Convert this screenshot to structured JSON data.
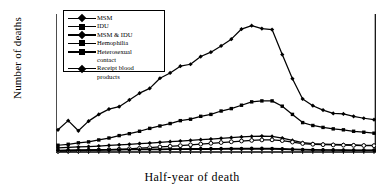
{
  "chart_data": {
    "type": "line",
    "title": "",
    "xlabel": "Half-year of death",
    "ylabel": "Number of deaths",
    "ylim": [
      0,
      14000
    ],
    "ytick_labels": [
      "0",
      "2,000",
      "4,000",
      "6,000",
      "8,000",
      "10,000",
      "12,000",
      "14,000"
    ],
    "ytick_values": [
      0,
      2000,
      4000,
      6000,
      8000,
      10000,
      12000,
      14000
    ],
    "grid": false,
    "legend_position": "upper-left-inside",
    "x_year_labels": [
      "1985",
      "1986",
      "1987",
      "1988",
      "1989",
      "1990",
      "1991",
      "1992",
      "1993",
      "1994",
      "1995",
      "1996",
      "1997",
      "1998",
      "1999",
      "2000"
    ],
    "x_note": "two half-year points per year",
    "x": [
      1985.0,
      1985.5,
      1986.0,
      1986.5,
      1987.0,
      1987.5,
      1988.0,
      1988.5,
      1989.0,
      1989.5,
      1990.0,
      1990.5,
      1991.0,
      1991.5,
      1992.0,
      1992.5,
      1993.0,
      1993.5,
      1994.0,
      1994.5,
      1995.0,
      1995.5,
      1996.0,
      1996.5,
      1997.0,
      1997.5,
      1998.0,
      1998.5,
      1999.0,
      1999.5,
      2000.0,
      2000.5
    ],
    "series": [
      {
        "name": "MSM",
        "marker": "diamond",
        "values": [
          2300,
          3250,
          2200,
          3200,
          3900,
          4450,
          4700,
          5400,
          6100,
          6600,
          7650,
          8200,
          8900,
          9100,
          9900,
          10350,
          11000,
          11700,
          12750,
          13100,
          12800,
          12700,
          10100,
          7600,
          5500,
          4800,
          4350,
          4000,
          3950,
          3700,
          3500,
          3350
        ]
      },
      {
        "name": "IDU",
        "marker": "square",
        "values": [
          700,
          800,
          950,
          1050,
          1250,
          1450,
          1700,
          1900,
          2150,
          2450,
          2700,
          2950,
          3250,
          3400,
          3700,
          3900,
          4250,
          4500,
          4850,
          5200,
          5300,
          5300,
          4750,
          3900,
          3050,
          2750,
          2550,
          2400,
          2300,
          2150,
          2050,
          1950
        ]
      },
      {
        "name": "MSM & IDU",
        "marker": "diamond",
        "values": [
          420,
          470,
          520,
          560,
          620,
          680,
          740,
          800,
          870,
          930,
          1000,
          1070,
          1140,
          1200,
          1280,
          1340,
          1420,
          1500,
          1560,
          1620,
          1650,
          1620,
          1450,
          1200,
          980,
          880,
          820,
          780,
          760,
          730,
          700,
          680
        ]
      },
      {
        "name": "Hemophilia",
        "marker": "circle-filled",
        "values": [
          180,
          200,
          215,
          230,
          245,
          255,
          270,
          280,
          290,
          300,
          310,
          320,
          330,
          340,
          350,
          355,
          360,
          365,
          370,
          375,
          375,
          370,
          340,
          300,
          265,
          245,
          230,
          220,
          215,
          205,
          200,
          195
        ]
      },
      {
        "name": "Heterosexual contact",
        "marker": "circle-open",
        "values": [
          90,
          110,
          130,
          160,
          195,
          235,
          280,
          330,
          390,
          450,
          520,
          590,
          660,
          740,
          820,
          900,
          980,
          1060,
          1140,
          1200,
          1250,
          1260,
          1180,
          1030,
          880,
          800,
          760,
          730,
          710,
          690,
          670,
          655
        ]
      },
      {
        "name": "Receipt blood products",
        "marker": "diamond",
        "values": [
          150,
          165,
          180,
          195,
          205,
          215,
          225,
          235,
          245,
          250,
          258,
          265,
          270,
          275,
          280,
          285,
          288,
          292,
          295,
          298,
          298,
          292,
          270,
          240,
          215,
          200,
          190,
          182,
          178,
          172,
          168,
          165
        ]
      }
    ],
    "legend_entries": [
      {
        "label": "MSM",
        "marker": "diamond"
      },
      {
        "label": "IDU",
        "marker": "square"
      },
      {
        "label": "MSM & IDU",
        "marker": "diamond"
      },
      {
        "label": "Hemophilia",
        "marker": "circle-filled"
      },
      {
        "label": "Heterosexual",
        "label2": "contact",
        "marker": "circle-open"
      },
      {
        "label": "Receipt blood",
        "label2": "products",
        "marker": "diamond"
      }
    ]
  }
}
